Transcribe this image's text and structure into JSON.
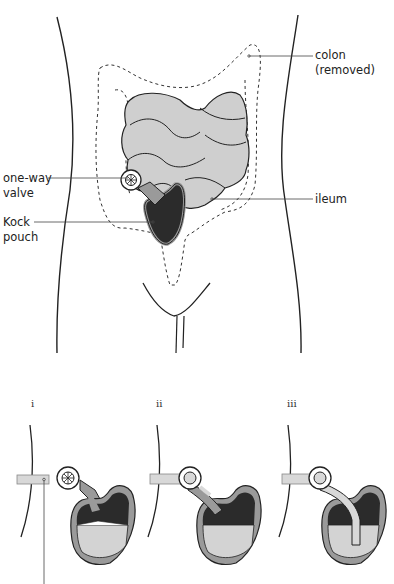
{
  "labels": {
    "colon_line1": "colon",
    "colon_line2": "(removed)",
    "valve_line1": "one-way",
    "valve_line2": "valve",
    "pouch_line1": "Kock",
    "pouch_line2": "pouch",
    "ileum": "ileum"
  },
  "steps": [
    {
      "label": "i"
    },
    {
      "label": "ii"
    },
    {
      "label": "iii"
    }
  ],
  "colors": {
    "outline": "#222222",
    "intestine_fill": "#cfcfcf",
    "pouch_dark": "#2b2b2b",
    "pouch_wall": "#9a9a9a",
    "fluid": "#d3d3d3",
    "tube": "#d8d8d8"
  }
}
